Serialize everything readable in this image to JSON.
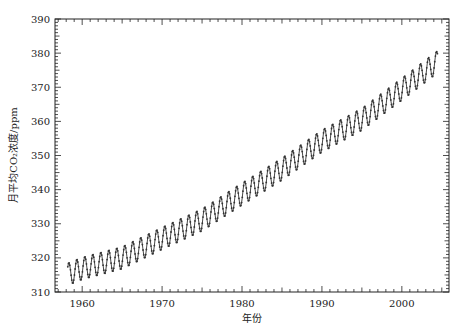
{
  "chart_data": {
    "type": "line",
    "title": "",
    "xlabel": "年份",
    "ylabel": "月平均CO₂浓度/ppm",
    "xlim": [
      1956.6,
      2005.9
    ],
    "ylim": [
      310,
      390
    ],
    "xticks": [
      1960,
      1970,
      1980,
      1990,
      2000
    ],
    "yticks": [
      310,
      320,
      330,
      340,
      350,
      360,
      370,
      380,
      390
    ],
    "grid": false,
    "legend": null,
    "series": [
      {
        "name": "Monthly mean CO2 (Mauna Loa)",
        "style": "line with point markers",
        "color": "#333333",
        "x_start": 1958.2,
        "x_end": 2004.5,
        "trend_points": [
          {
            "x": 1958,
            "y": 315.0
          },
          {
            "x": 1960,
            "y": 316.9
          },
          {
            "x": 1965,
            "y": 320.0
          },
          {
            "x": 1970,
            "y": 325.7
          },
          {
            "x": 1975,
            "y": 331.1
          },
          {
            "x": 1980,
            "y": 338.7
          },
          {
            "x": 1985,
            "y": 346.0
          },
          {
            "x": 1990,
            "y": 354.2
          },
          {
            "x": 1995,
            "y": 360.6
          },
          {
            "x": 2000,
            "y": 369.4
          },
          {
            "x": 2004.5,
            "y": 377.5
          }
        ],
        "seasonal_amplitude_ppm": 6.5,
        "seasonal_peak_month": 5
      }
    ]
  },
  "axes": {
    "x_tick_labels": [
      "1960",
      "1970",
      "1980",
      "1990",
      "2000"
    ],
    "y_tick_labels": [
      "310",
      "320",
      "330",
      "340",
      "350",
      "360",
      "370",
      "380",
      "390"
    ]
  }
}
